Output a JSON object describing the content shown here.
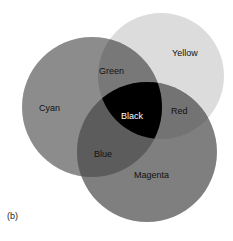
{
  "figure": {
    "panel_label": "(b)"
  },
  "circles": [
    {
      "name": "Cyan",
      "cx": 92,
      "cy": 107,
      "r": 70,
      "fill": "#8c8c8c"
    },
    {
      "name": "Yellow",
      "cx": 161,
      "cy": 76,
      "r": 63,
      "fill": "#dcdcdc"
    },
    {
      "name": "Magenta",
      "cx": 147,
      "cy": 152,
      "r": 70,
      "fill": "#7f7f7f"
    }
  ],
  "overlaps": {
    "cyan_yellow": {
      "name": "Green",
      "fill": "#787878"
    },
    "yellow_magenta": {
      "name": "Red",
      "fill": "#737373"
    },
    "cyan_magenta": {
      "name": "Blue",
      "fill": "#5c5c5c"
    },
    "all": {
      "name": "Black",
      "fill": "#000000"
    }
  },
  "labels": {
    "cyan": "Cyan",
    "yellow": "Yellow",
    "magenta": "Magenta",
    "green": "Green",
    "red": "Red",
    "blue": "Blue",
    "black": "Black"
  }
}
